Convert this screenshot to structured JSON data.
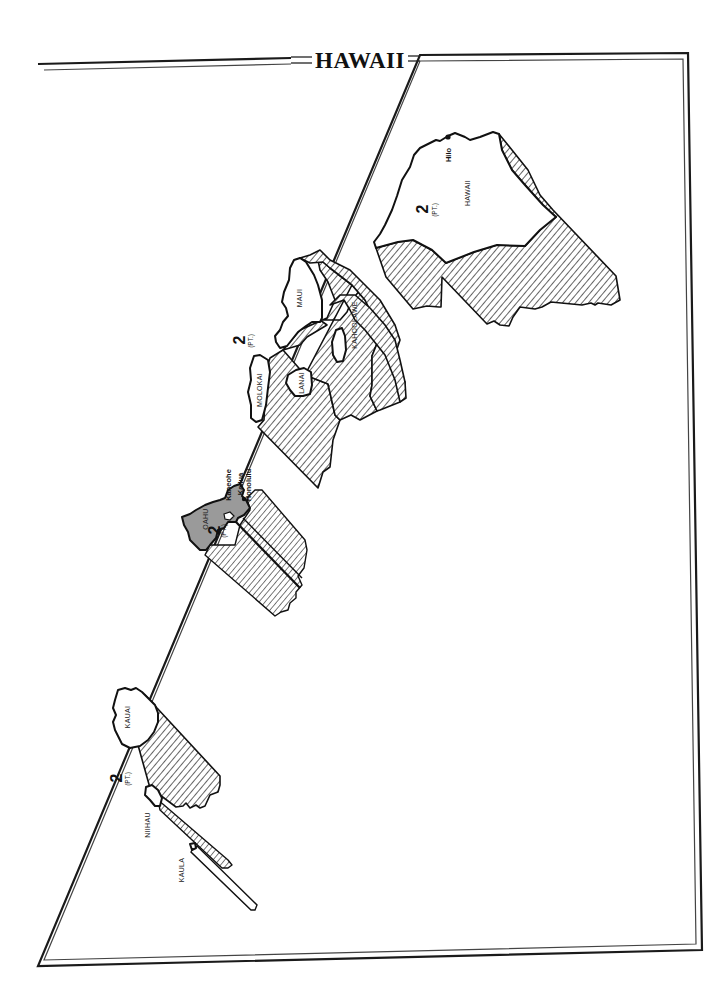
{
  "title": "HAWAII",
  "colors": {
    "ink": "#111111",
    "paper": "#ffffff",
    "oahu_fill": "#9a9a9a"
  },
  "islands": [
    {
      "name": "HAWAII",
      "district": "2",
      "district_note": "(PT.)",
      "cities": [
        "Hilo"
      ]
    },
    {
      "name": "MAUI",
      "district": "2",
      "district_note": "(PT.)",
      "cities": []
    },
    {
      "name": "KAHOOLAWE",
      "cities": []
    },
    {
      "name": "LANAI",
      "cities": []
    },
    {
      "name": "MOLOKAI",
      "cities": []
    },
    {
      "name": "OAHU",
      "district": "2",
      "district_note": "(PT.)",
      "cities": [
        "Kaneohe",
        "Kailua",
        "Honolulu"
      ]
    },
    {
      "name": "KAUAI",
      "district": "2",
      "district_note": "(PT.)",
      "cities": []
    },
    {
      "name": "NIIHAU",
      "cities": []
    },
    {
      "name": "KAULA",
      "cities": []
    }
  ],
  "labels": {
    "hawaii": "HAWAII",
    "hilo": "Hilo",
    "maui": "MAUI",
    "kahoolawe": "KAHOOLAWE",
    "lanai": "LANAI",
    "molokai": "MOLOKAI",
    "oahu": "OAHU",
    "kaneohe": "Kaneohe",
    "kailua": "Kailua",
    "honolulu": "Honolulu",
    "kauai": "KAUAI",
    "niihau": "NIIHAU",
    "kaula": "KAULA",
    "district_num": "2",
    "district_pt": "(PT.)"
  }
}
